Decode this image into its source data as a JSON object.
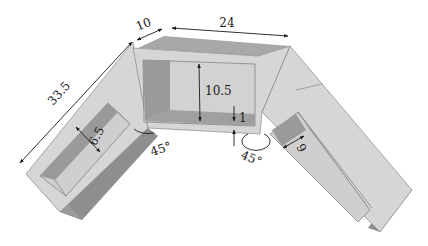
{
  "diagram": {
    "type": "3D isometric drawing of a V-shaped trough with two 45-degree angled arms",
    "colors": {
      "top_face": "#d6d6d6",
      "top_face_dark": "#a8a8a8",
      "side_face": "#8e8e8e",
      "inner_back": "#d0d0d0",
      "inner_side": "#9a9a9a",
      "outline": "#6a6a6a",
      "dimension_line": "#1a1a1a"
    },
    "dimensions": {
      "arm_length": "33.5",
      "wall_width": "10",
      "center_length": "24",
      "center_height": "10.5",
      "floor_thickness": "1",
      "left_arm_inner_width": "6.5",
      "right_arm_inner_width": "9"
    },
    "angles": {
      "left_joint": "45°",
      "right_joint": "45°"
    }
  }
}
